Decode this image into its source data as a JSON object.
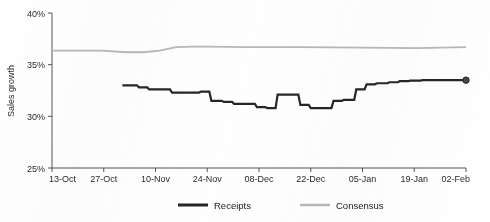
{
  "chart_data": {
    "type": "line",
    "title": "",
    "xlabel": "",
    "ylabel": "Sales growth",
    "ylim": [
      25,
      40
    ],
    "yticks": [
      25,
      30,
      35,
      40
    ],
    "ytick_labels": [
      "25%",
      "30%",
      "35%",
      "40%"
    ],
    "grid": false,
    "legend_position": "bottom",
    "categories": [
      "13-Oct",
      "27-Oct",
      "10-Nov",
      "24-Nov",
      "08-Dec",
      "22-Dec",
      "05-Jan",
      "19-Jan",
      "02-Feb"
    ],
    "xtick_labels": [
      "13-Oct",
      "27-Oct",
      "10-Nov",
      "24-Nov",
      "08-Dec",
      "22-Dec",
      "05-Jan",
      "19-Jan",
      "02-Feb"
    ],
    "series": [
      {
        "name": "Receipts",
        "color": "#262626",
        "style": "step",
        "end_marker": true,
        "end_value": 33.5,
        "x": [
          17.0,
          18.5,
          19.0,
          20.5,
          21.0,
          23.0,
          23.5,
          25.5,
          26.0,
          28.5,
          29.0,
          31.0,
          31.5,
          33.5,
          34.0,
          35.5,
          36.0,
          38.0,
          38.5,
          41.0,
          41.5,
          43.5,
          44.0,
          46.0,
          46.5,
          49.0,
          49.5,
          51.5,
          52.0,
          54.0,
          54.5,
          57.0,
          57.5,
          59.5,
          60.0,
          62.0,
          62.5,
          65.0,
          65.5,
          67.5,
          68.0,
          70.0,
          70.5,
          73.0,
          73.5,
          75.5,
          76.0,
          78.0,
          78.5,
          81.0,
          81.5,
          83.5,
          84.0,
          86.0,
          86.5,
          89.0,
          89.5,
          100.0
        ],
        "y": [
          33.0,
          33.0,
          33.0,
          33.0,
          32.8,
          32.8,
          32.6,
          32.6,
          32.6,
          32.6,
          32.3,
          32.3,
          32.3,
          32.3,
          32.3,
          32.3,
          32.4,
          32.4,
          31.5,
          31.5,
          31.4,
          31.4,
          31.2,
          31.2,
          31.2,
          31.2,
          30.9,
          30.9,
          30.8,
          30.8,
          32.1,
          32.1,
          32.1,
          32.1,
          31.1,
          31.1,
          30.8,
          30.8,
          30.8,
          30.8,
          31.5,
          31.5,
          31.6,
          31.6,
          32.6,
          32.6,
          33.1,
          33.1,
          33.2,
          33.2,
          33.3,
          33.3,
          33.4,
          33.4,
          33.45,
          33.45,
          33.5,
          33.5
        ],
        "values_summary": {
          "start": 33.0,
          "min": 30.8,
          "max": 33.5,
          "end": 33.5
        }
      },
      {
        "name": "Consensus",
        "color": "#b8b8b8",
        "style": "line",
        "end_marker": false,
        "x": [
          0,
          12,
          18,
          22,
          26,
          30,
          34,
          38,
          46,
          60,
          75,
          88,
          100
        ],
        "y": [
          36.35,
          36.35,
          36.2,
          36.2,
          36.35,
          36.7,
          36.75,
          36.75,
          36.7,
          36.7,
          36.65,
          36.6,
          36.7
        ],
        "values_summary": {
          "start": 36.35,
          "min": 36.2,
          "max": 36.75,
          "end": 36.7
        }
      }
    ]
  },
  "legend": {
    "items": [
      {
        "label": "Receipts",
        "color": "#262626"
      },
      {
        "label": "Consensus",
        "color": "#b8b8b8"
      }
    ]
  },
  "axes": {
    "y_axis_title": "Sales growth"
  }
}
